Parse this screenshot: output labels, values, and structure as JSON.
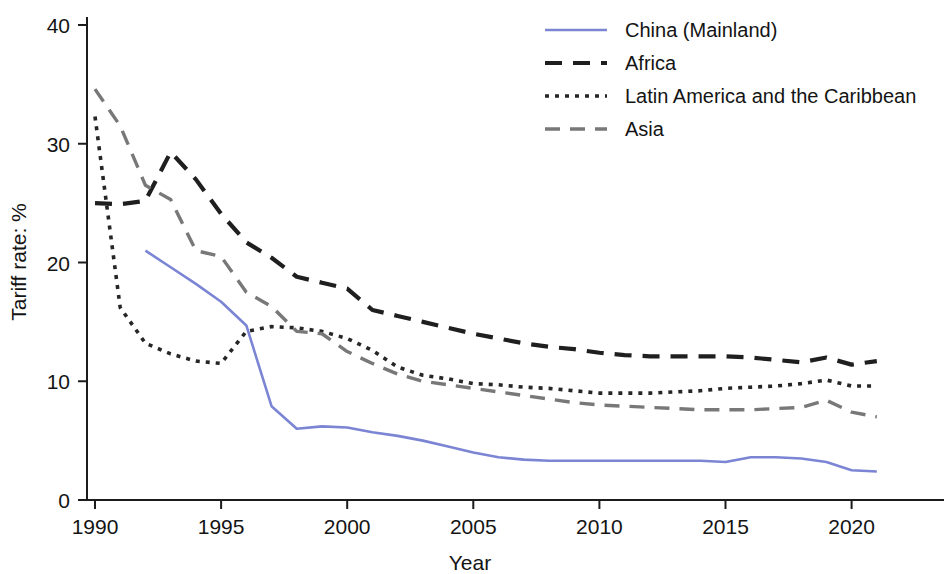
{
  "chart_data": {
    "type": "line",
    "title": "",
    "xlabel": "Year",
    "ylabel": "Tariff rate: %",
    "xlim": [
      1989.6,
      2021.8
    ],
    "ylim": [
      0,
      41
    ],
    "xticks": [
      1990,
      1995,
      2000,
      2005,
      2010,
      2015,
      2020
    ],
    "yticks": [
      0,
      10,
      20,
      30,
      40
    ],
    "grid": false,
    "legend_position": "top-right",
    "series": [
      {
        "name": "China (Mainland)",
        "color": "#7b85d4",
        "dash": "solid",
        "x": [
          1992,
          1993,
          1994,
          1995,
          1996,
          1997,
          1998,
          1999,
          2000,
          2001,
          2002,
          2003,
          2004,
          2005,
          2006,
          2007,
          2008,
          2009,
          2010,
          2011,
          2012,
          2013,
          2014,
          2015,
          2016,
          2017,
          2018,
          2019,
          2020,
          2021
        ],
        "values": [
          21.0,
          19.6,
          18.2,
          16.7,
          14.7,
          7.9,
          6.0,
          6.2,
          6.1,
          5.7,
          5.4,
          5.0,
          4.5,
          4.0,
          3.6,
          3.4,
          3.3,
          3.3,
          3.3,
          3.3,
          3.3,
          3.3,
          3.3,
          3.2,
          3.6,
          3.6,
          3.5,
          3.2,
          2.5,
          2.4
        ]
      },
      {
        "name": "Africa",
        "color": "#1f1f1f",
        "dash": "long-dash",
        "x": [
          1990,
          1991,
          1992,
          1993,
          1994,
          1995,
          1996,
          1997,
          1998,
          1999,
          2000,
          2001,
          2002,
          2003,
          2004,
          2005,
          2006,
          2007,
          2008,
          2009,
          2010,
          2011,
          2012,
          2013,
          2014,
          2015,
          2016,
          2017,
          2018,
          2019,
          2020,
          2021
        ],
        "values": [
          25.0,
          24.9,
          25.2,
          29.3,
          27.0,
          24.1,
          21.7,
          20.4,
          18.8,
          18.3,
          17.8,
          16.0,
          15.5,
          15.0,
          14.5,
          14.0,
          13.6,
          13.2,
          12.9,
          12.7,
          12.4,
          12.2,
          12.1,
          12.1,
          12.1,
          12.1,
          12.0,
          11.8,
          11.6,
          12.0,
          11.4,
          11.7
        ]
      },
      {
        "name": "Latin America and the Caribbean",
        "color": "#262626",
        "dash": "dotted",
        "x": [
          1990,
          1991,
          1992,
          1993,
          1994,
          1995,
          1996,
          1997,
          1998,
          1999,
          2000,
          2001,
          2002,
          2003,
          2004,
          2005,
          2006,
          2007,
          2008,
          2009,
          2010,
          2011,
          2012,
          2013,
          2014,
          2015,
          2016,
          2017,
          2018,
          2019,
          2020,
          2021
        ],
        "values": [
          32.3,
          16.2,
          13.2,
          12.3,
          11.7,
          11.5,
          14.2,
          14.6,
          14.5,
          14.2,
          13.6,
          12.6,
          11.2,
          10.5,
          10.2,
          9.8,
          9.7,
          9.5,
          9.4,
          9.2,
          9.0,
          9.0,
          9.0,
          9.1,
          9.2,
          9.4,
          9.5,
          9.6,
          9.8,
          10.1,
          9.6,
          9.6
        ]
      },
      {
        "name": "Asia",
        "color": "#787878",
        "dash": "dash",
        "x": [
          1990,
          1991,
          1992,
          1993,
          1994,
          1995,
          1996,
          1997,
          1998,
          1999,
          2000,
          2001,
          2002,
          2003,
          2004,
          2005,
          2006,
          2007,
          2008,
          2009,
          2010,
          2011,
          2012,
          2013,
          2014,
          2015,
          2016,
          2017,
          2018,
          2019,
          2020,
          2021
        ],
        "values": [
          34.6,
          31.5,
          26.5,
          25.3,
          21.0,
          20.5,
          17.5,
          16.3,
          14.2,
          14.0,
          12.5,
          11.5,
          10.6,
          10.0,
          9.7,
          9.4,
          9.1,
          8.8,
          8.5,
          8.2,
          8.0,
          7.9,
          7.8,
          7.7,
          7.6,
          7.6,
          7.6,
          7.7,
          7.8,
          8.4,
          7.4,
          7.0
        ]
      }
    ]
  },
  "legend": {
    "items": [
      {
        "label": "China (Mainland)"
      },
      {
        "label": "Africa"
      },
      {
        "label": "Latin America and the Caribbean"
      },
      {
        "label": "Asia"
      }
    ]
  }
}
